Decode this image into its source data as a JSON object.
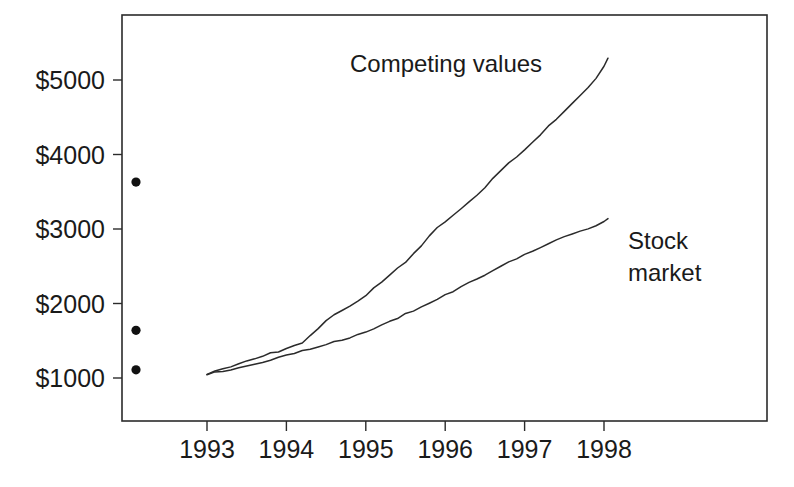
{
  "chart_data": {
    "type": "line",
    "title": "",
    "xlabel": "",
    "ylabel": "",
    "xlim": [
      1992.83,
      1998.05
    ],
    "ylim": [
      750,
      5550
    ],
    "grid": false,
    "legend_position": "inline-annotations",
    "y_tick_labels": [
      "$5000",
      "$4000",
      "$3000",
      "$2000",
      "$1000"
    ],
    "y_tick_values": [
      5000,
      4000,
      3000,
      2000,
      1000
    ],
    "x_tick_labels": [
      "1993",
      "1994",
      "1995",
      "1996",
      "1997",
      "1998"
    ],
    "x_tick_values": [
      1993,
      1994,
      1995,
      1996,
      1997,
      1998
    ],
    "series": [
      {
        "name": "Competing values",
        "label": "Competing values",
        "x": [
          1993.0,
          1993.1,
          1993.2,
          1993.3,
          1993.4,
          1993.5,
          1993.6,
          1993.7,
          1993.8,
          1993.9,
          1994.0,
          1994.1,
          1994.2,
          1994.3,
          1994.4,
          1994.5,
          1994.6,
          1994.7,
          1994.8,
          1994.9,
          1995.0,
          1995.1,
          1995.2,
          1995.3,
          1995.4,
          1995.5,
          1995.6,
          1995.7,
          1995.8,
          1995.9,
          1996.0,
          1996.1,
          1996.2,
          1996.3,
          1996.4,
          1996.5,
          1996.6,
          1996.7,
          1996.8,
          1996.9,
          1997.0,
          1997.1,
          1997.2,
          1997.3,
          1997.4,
          1997.5,
          1997.6,
          1997.7,
          1997.8,
          1997.9,
          1998.0,
          1998.05
        ],
        "values": [
          1050,
          1090,
          1125,
          1160,
          1195,
          1230,
          1265,
          1300,
          1330,
          1360,
          1390,
          1430,
          1480,
          1560,
          1660,
          1760,
          1840,
          1910,
          1975,
          2040,
          2110,
          2200,
          2290,
          2380,
          2470,
          2560,
          2660,
          2780,
          2900,
          3010,
          3100,
          3190,
          3280,
          3370,
          3460,
          3560,
          3670,
          3780,
          3880,
          3970,
          4060,
          4160,
          4270,
          4380,
          4480,
          4580,
          4680,
          4790,
          4900,
          5020,
          5180,
          5300
        ]
      },
      {
        "name": "Stock market",
        "label": "Stock market",
        "label_line1": "Stock",
        "label_line2": "market",
        "x": [
          1993.0,
          1993.1,
          1993.2,
          1993.3,
          1993.4,
          1993.5,
          1993.6,
          1993.7,
          1993.8,
          1993.9,
          1994.0,
          1994.1,
          1994.2,
          1994.3,
          1994.4,
          1994.5,
          1994.6,
          1994.7,
          1994.8,
          1994.9,
          1995.0,
          1995.1,
          1995.2,
          1995.3,
          1995.4,
          1995.5,
          1995.6,
          1995.7,
          1995.8,
          1995.9,
          1996.0,
          1996.1,
          1996.2,
          1996.3,
          1996.4,
          1996.5,
          1996.6,
          1996.7,
          1996.8,
          1996.9,
          1997.0,
          1997.1,
          1997.2,
          1997.3,
          1997.4,
          1997.5,
          1997.6,
          1997.7,
          1997.8,
          1997.9,
          1998.0,
          1998.05
        ],
        "values": [
          1050,
          1072,
          1094,
          1116,
          1138,
          1160,
          1185,
          1210,
          1240,
          1270,
          1300,
          1330,
          1360,
          1392,
          1425,
          1455,
          1485,
          1515,
          1548,
          1582,
          1620,
          1665,
          1712,
          1760,
          1808,
          1856,
          1905,
          1955,
          2005,
          2055,
          2110,
          2165,
          2222,
          2280,
          2335,
          2390,
          2445,
          2500,
          2552,
          2602,
          2650,
          2700,
          2752,
          2800,
          2845,
          2890,
          2930,
          2968,
          3005,
          3045,
          3095,
          3130
        ]
      }
    ],
    "markers": [
      {
        "name": "dot-upper",
        "x_px_value": 136,
        "value": 3630
      },
      {
        "name": "dot-middle",
        "x_px_value": 136,
        "value": 1640
      },
      {
        "name": "dot-lower",
        "x_px_value": 136,
        "value": 1110
      }
    ],
    "annotations": [
      {
        "name": "competing-values-label",
        "text": "Competing values",
        "value_x": 1995.75,
        "value_y": 4950
      },
      {
        "name": "stock-market-label-line1",
        "text": "Stock",
        "value_x": 1997.85,
        "value_y": 3000
      },
      {
        "name": "stock-market-label-line2",
        "text": "market",
        "value_x": 1997.85,
        "value_y": 2600
      }
    ]
  }
}
